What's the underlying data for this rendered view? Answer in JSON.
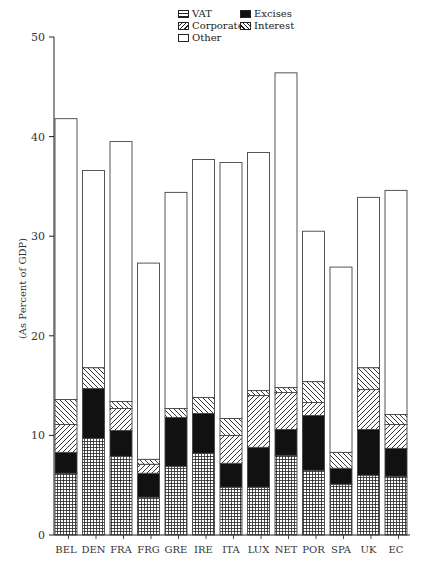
{
  "chart_data": {
    "type": "bar",
    "stacked": true,
    "title": "",
    "xlabel": "",
    "ylabel": "(As Percent of GDP)",
    "ylim": [
      0,
      50
    ],
    "yticks": [
      0,
      10,
      20,
      30,
      40,
      50
    ],
    "grid": false,
    "legend_position": "top-center",
    "categories": [
      "BEL",
      "DEN",
      "FRA",
      "FRG",
      "GRE",
      "IRE",
      "ITA",
      "LUX",
      "NET",
      "POR",
      "SPA",
      "UK",
      "EC"
    ],
    "series": [
      {
        "name": "VAT",
        "pattern": "grid",
        "values": [
          6.2,
          9.7,
          7.9,
          3.8,
          6.9,
          8.2,
          4.8,
          4.8,
          8.0,
          6.5,
          5.1,
          6.0,
          5.9
        ]
      },
      {
        "name": "Excises",
        "pattern": "solid",
        "values": [
          2.1,
          5.0,
          2.6,
          2.4,
          4.9,
          4.0,
          2.4,
          4.0,
          2.6,
          5.5,
          1.6,
          4.6,
          2.8
        ]
      },
      {
        "name": "Corporate",
        "pattern": "forward-diagonal",
        "values": [
          2.8,
          0.0,
          2.2,
          0.9,
          0.0,
          0.0,
          2.8,
          5.2,
          3.7,
          1.3,
          0.0,
          4.0,
          2.4
        ]
      },
      {
        "name": "Interest",
        "pattern": "back-diagonal",
        "values": [
          2.5,
          2.1,
          0.7,
          0.5,
          0.9,
          1.6,
          1.7,
          0.5,
          0.5,
          2.1,
          1.6,
          2.2,
          1.0
        ]
      },
      {
        "name": "Other",
        "pattern": "empty",
        "values": [
          28.2,
          19.8,
          26.1,
          19.7,
          21.7,
          23.9,
          25.7,
          23.9,
          31.6,
          15.1,
          18.6,
          17.1,
          22.5
        ]
      }
    ],
    "totals": [
      41.8,
      36.6,
      39.5,
      27.3,
      34.4,
      37.7,
      37.4,
      38.4,
      46.4,
      30.5,
      26.9,
      33.9,
      34.6
    ]
  },
  "legend": [
    {
      "label": "VAT",
      "pattern": "grid"
    },
    {
      "label": "Excises",
      "pattern": "solid"
    },
    {
      "label": "Corporate",
      "pattern": "forward-diagonal"
    },
    {
      "label": "Interest",
      "pattern": "back-diagonal"
    },
    {
      "label": "Other",
      "pattern": "empty"
    }
  ],
  "colors": {
    "ink": "#222222",
    "background": "#ffffff"
  }
}
